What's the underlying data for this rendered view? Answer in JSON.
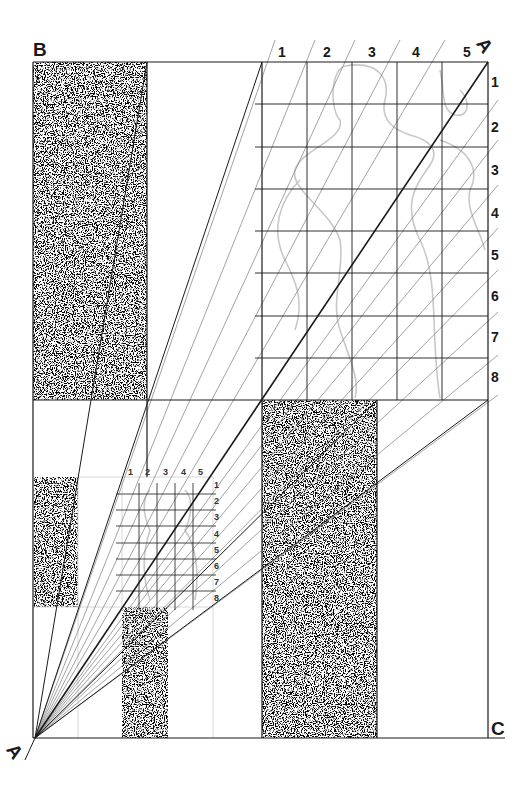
{
  "diagram": {
    "corner_labels": {
      "top_left": "B",
      "top_right": "A",
      "bottom_left": "A",
      "bottom_right": "C"
    },
    "large_grid": {
      "column_labels": [
        "1",
        "2",
        "3",
        "4",
        "5"
      ],
      "row_labels": [
        "1",
        "2",
        "3",
        "4",
        "5",
        "6",
        "7",
        "8"
      ]
    },
    "small_grid": {
      "column_labels": [
        "1",
        "2",
        "3",
        "4",
        "5"
      ],
      "row_labels": [
        "1",
        "2",
        "3",
        "4",
        "5",
        "6",
        "7",
        "8"
      ]
    },
    "colors": {
      "line": "#1a1a1a",
      "construction_line": "#8c8c8c",
      "sketch": "#c8c8c8",
      "stipple": "#2b2b2b"
    }
  }
}
